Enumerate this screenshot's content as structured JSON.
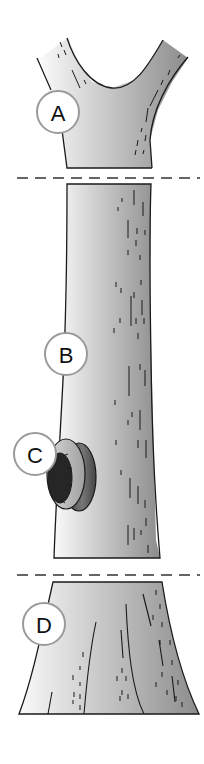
{
  "diagram": {
    "sections": [
      {
        "id": "A",
        "label": "A",
        "part": "branch-fork"
      },
      {
        "id": "B",
        "label": "B",
        "part": "trunk-middle"
      },
      {
        "id": "C",
        "label": "C",
        "part": "trunk-cavity"
      },
      {
        "id": "D",
        "label": "D",
        "part": "trunk-base"
      }
    ],
    "colors": {
      "bark_light": "#f4f4f4",
      "bark_dark": "#8a8a8a",
      "outline": "#1a1a1a",
      "cavity_dark": "#262626",
      "cut_line": "#333333",
      "label_ring": "#9a9a9a"
    }
  }
}
